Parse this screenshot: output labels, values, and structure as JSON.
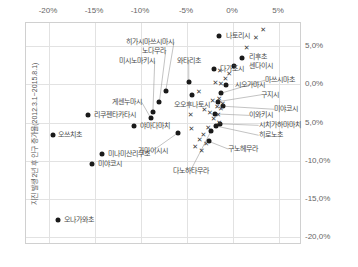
{
  "chart_data": {
    "type": "scatter",
    "title": "",
    "xlabel": "",
    "ylabel": "지진 발생 2년 후 인구 증가율(2012.3.1~2015.8.1)",
    "x_axis_position": "top",
    "y_axis_position": "right",
    "grid": true,
    "legend": "none",
    "xlim": [
      -22.5,
      7.5
    ],
    "ylim": [
      -21.0,
      8.0
    ],
    "x_ticks": [
      "-20%",
      "-15%",
      "-10%",
      "-5%",
      "0%",
      "5%"
    ],
    "x_tick_values": [
      -20,
      -15,
      -10,
      -5,
      0,
      5
    ],
    "y_ticks": [
      "5,0%",
      "0,0%",
      "5,0%",
      "-10,0%",
      "-15,0%",
      "-20,0%"
    ],
    "y_tick_values": [
      5,
      0,
      -5,
      -10,
      -15,
      -20
    ],
    "series": [
      {
        "name": "labeled-municipalities",
        "marker": "circle",
        "points": [
          {
            "label": "나토리시",
            "x": -1.4,
            "y": 6.2,
            "label_pos": "l",
            "lx": -0.6,
            "ly": 6.2,
            "leader": false
          },
          {
            "label": "리후초",
            "x": 1.1,
            "y": 3.3,
            "label_pos": "l",
            "lx": 1.9,
            "ly": 3.4,
            "leader": false
          },
          {
            "label": "센다이시",
            "x": 0.2,
            "y": 2.3,
            "label_pos": "l",
            "lx": 1.9,
            "ly": 2.3,
            "leader": false
          },
          {
            "label": "다가조시",
            "x": -2.0,
            "y": 1.9,
            "label_pos": "l",
            "lx": -1.3,
            "ly": 1.9,
            "leader": false
          },
          {
            "label": "와타리초",
            "x": -4.7,
            "y": 0.1,
            "label_pos": "c",
            "lx": -4.7,
            "ly": 2.9,
            "leader": true
          },
          {
            "label": "히가시마쓰시마시",
            "x": -7.2,
            "y": -1.0,
            "label_pos": "r",
            "lx": -6.3,
            "ly": 5.4,
            "leader": true
          },
          {
            "label": "노다무라",
            "x": -7.9,
            "y": -2.5,
            "label_pos": "r",
            "lx": -7.2,
            "ly": 4.2,
            "leader": true
          },
          {
            "label": "미시노마키시",
            "x": -8.6,
            "y": -3.8,
            "label_pos": "r",
            "lx": -8.4,
            "ly": 2.9,
            "leader": true
          },
          {
            "label": "오오후나토시",
            "x": -4.4,
            "y": -1.5,
            "label_pos": "c",
            "lx": -4.4,
            "ly": -2.9,
            "leader": false
          },
          {
            "label": "게센누마시",
            "x": -8.8,
            "y": -4.6,
            "label_pos": "r",
            "lx": -9.8,
            "ly": -2.5,
            "leader": true
          },
          {
            "label": "리쿠젠타카타시",
            "x": -15.6,
            "y": -4.1,
            "label_pos": "l",
            "lx": -15.0,
            "ly": -4.1,
            "leader": false
          },
          {
            "label": "야마다마치",
            "x": -10.6,
            "y": -5.6,
            "label_pos": "l",
            "lx": -10.0,
            "ly": -5.6,
            "leader": false
          },
          {
            "label": "오쓰치초",
            "x": -19.5,
            "y": -6.8,
            "label_pos": "l",
            "lx": -18.9,
            "ly": -6.8,
            "leader": false
          },
          {
            "label": "가마이시시",
            "x": -5.9,
            "y": -6.5,
            "label_pos": "c",
            "lx": -8.6,
            "ly": -8.8,
            "leader": true
          },
          {
            "label": "미나미산리쿠초",
            "x": -14.1,
            "y": -9.2,
            "label_pos": "l",
            "lx": -13.5,
            "ly": -9.2,
            "leader": false
          },
          {
            "label": "미야코시",
            "x": -15.2,
            "y": -10.6,
            "label_pos": "l",
            "lx": -14.6,
            "ly": -10.6,
            "leader": false
          },
          {
            "label": "오나가와초",
            "x": -18.9,
            "y": -17.9,
            "label_pos": "l",
            "lx": -18.3,
            "ly": -17.9,
            "leader": false
          },
          {
            "label": "다노하타무라",
            "x": -2.3,
            "y": -6.3,
            "label_pos": "c",
            "lx": -4.5,
            "ly": -11.4,
            "leader": true
          },
          {
            "label": "시오가마시",
            "x": -0.6,
            "y": -0.2,
            "label_pos": "l",
            "lx": 0.3,
            "ly": -0.2,
            "leader": false
          },
          {
            "label": "마쓰시마초",
            "x": -1.2,
            "y": -1.3,
            "label_pos": "l",
            "lx": 3.6,
            "ly": 0.4,
            "leader": true
          },
          {
            "label": "구지시",
            "x": -1.5,
            "y": -2.4,
            "label_pos": "l",
            "lx": 3.2,
            "ly": -1.5,
            "leader": true
          },
          {
            "label": "미야코시 (우)",
            "x": -1.0,
            "y": -3.0,
            "label_pos": "l",
            "lx": 4.6,
            "ly": -3.4,
            "leader": true
          },
          {
            "label": "이와키시",
            "x": -1.9,
            "y": -4.0,
            "label_pos": "l",
            "lx": 1.9,
            "ly": -4.2,
            "leader": true
          },
          {
            "label": "시치가하마마치",
            "x": -1.3,
            "y": -5.3,
            "label_pos": "l",
            "lx": 2.9,
            "ly": -5.5,
            "leader": true
          },
          {
            "label": "히로노초",
            "x": -1.7,
            "y": -5.6,
            "label_pos": "l",
            "lx": 2.9,
            "ly": -6.8,
            "leader": true
          },
          {
            "label": "구노헤무라",
            "x": -2.5,
            "y": -7.6,
            "label_pos": "l",
            "lx": -0.4,
            "ly": -8.6,
            "leader": true
          }
        ]
      },
      {
        "name": "unlabeled-municipalities",
        "marker": "x",
        "points": [
          {
            "x": 3.4,
            "y": 7.0
          },
          {
            "x": 2.6,
            "y": 5.9
          },
          {
            "x": 1.6,
            "y": 4.6
          },
          {
            "x": -0.3,
            "y": 1.2
          },
          {
            "x": -1.3,
            "y": 1.6
          },
          {
            "x": -0.7,
            "y": 0.5
          },
          {
            "x": -1.8,
            "y": 0.0
          },
          {
            "x": -1.2,
            "y": -0.1
          },
          {
            "x": -3.6,
            "y": -1.1
          },
          {
            "x": -2.1,
            "y": -2.3
          },
          {
            "x": -1.4,
            "y": -2.1
          },
          {
            "x": -1.0,
            "y": -2.7
          },
          {
            "x": -1.6,
            "y": -3.1
          },
          {
            "x": -1.2,
            "y": -3.4
          },
          {
            "x": -3.0,
            "y": -3.5
          },
          {
            "x": -2.4,
            "y": -3.9
          },
          {
            "x": -1.5,
            "y": -4.1
          },
          {
            "x": -4.5,
            "y": -4.2
          },
          {
            "x": -2.0,
            "y": -4.7
          },
          {
            "x": -1.4,
            "y": -5.2
          },
          {
            "x": -2.6,
            "y": -5.9
          },
          {
            "x": -3.1,
            "y": -6.7
          },
          {
            "x": -3.5,
            "y": -7.4
          },
          {
            "x": -2.8,
            "y": -7.9
          },
          {
            "x": -4.0,
            "y": -8.3
          },
          {
            "x": -3.3,
            "y": -8.8
          },
          {
            "x": -4.4,
            "y": -6.0
          }
        ]
      }
    ]
  },
  "style": {
    "marker_color": "#1a1a1a",
    "grid_color": "#e2e2e2",
    "frame_color": "#d0d0d0",
    "label_color": "#4a4a4a"
  }
}
